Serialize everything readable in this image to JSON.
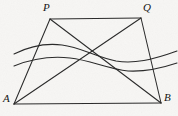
{
  "figure": {
    "kind": "geometry-diagram",
    "canvas": {
      "width": 178,
      "height": 116
    },
    "background_color": "#f7f6f4",
    "stroke_color": "#2b2b2b",
    "label_color": "#141414",
    "vertices": [
      {
        "name": "P",
        "label": "P",
        "x": 50,
        "y": 19,
        "label_x": 43,
        "label_y": 2
      },
      {
        "name": "Q",
        "label": "Q",
        "x": 141,
        "y": 18,
        "label_x": 143,
        "label_y": 2
      },
      {
        "name": "A",
        "label": "A",
        "x": 14,
        "y": 104,
        "label_x": 3,
        "label_y": 93
      },
      {
        "name": "B",
        "label": "B",
        "x": 161,
        "y": 103,
        "label_x": 164,
        "label_y": 92
      }
    ],
    "segments": [
      {
        "name": "side-PQ",
        "from": "P",
        "to": "Q"
      },
      {
        "name": "side-QB",
        "from": "Q",
        "to": "B"
      },
      {
        "name": "side-AB",
        "from": "A",
        "to": "B"
      },
      {
        "name": "side-AP",
        "from": "A",
        "to": "P"
      },
      {
        "name": "diagonal-AQ",
        "from": "A",
        "to": "Q"
      },
      {
        "name": "diagonal-PB",
        "from": "P",
        "to": "B"
      }
    ],
    "curves": [
      {
        "name": "upper-wavy-curve",
        "path": "M 14,54 C 32,45 46,43 62,45 C 80,47 96,57 116,61 C 134,64 152,60 177,51"
      },
      {
        "name": "lower-wavy-curve",
        "path": "M 14,66 C 34,58 52,56 70,58 C 90,60 108,69 128,71 C 146,72 162,68 177,63"
      }
    ]
  }
}
